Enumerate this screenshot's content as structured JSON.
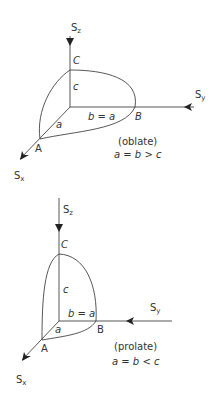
{
  "figures": [
    {
      "name": "oblate",
      "axes": {
        "z": {
          "base": "S",
          "sub": "z"
        },
        "y": {
          "base": "S",
          "sub": "y"
        },
        "x": {
          "base": "S",
          "sub": "x"
        }
      },
      "points": {
        "A": "A",
        "B": "B",
        "C": "C"
      },
      "segments": {
        "c": "c",
        "b": "b = a",
        "a": "a"
      },
      "caption": "(oblate)",
      "relation": "a = b > c"
    },
    {
      "name": "prolate",
      "axes": {
        "z": {
          "base": "S",
          "sub": "z"
        },
        "y": {
          "base": "S",
          "sub": "y"
        },
        "x": {
          "base": "S",
          "sub": "x"
        }
      },
      "points": {
        "A": "A",
        "B": "B",
        "C": "C"
      },
      "segments": {
        "c": "c",
        "b": "b = a",
        "a": "a"
      },
      "caption": "(prolate)",
      "relation": "a = b < c"
    }
  ]
}
